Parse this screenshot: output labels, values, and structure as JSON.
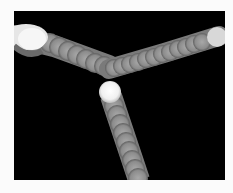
{
  "image": {
    "description": "Stroboscopic photograph of bright balls tracing paths on a black background",
    "colors": {
      "background": "#000000",
      "border": "#fbfbfb",
      "trail": "#8a8a8a",
      "ball": "#f4f4f4"
    }
  }
}
